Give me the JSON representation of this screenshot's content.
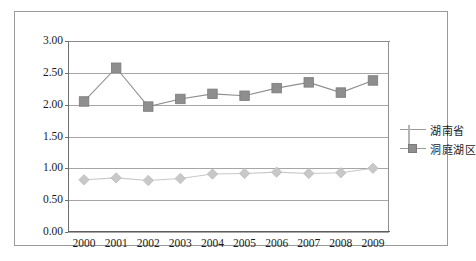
{
  "chart_data": {
    "type": "line",
    "title": "",
    "xlabel": "",
    "ylabel": "",
    "categories": [
      "2000",
      "2001",
      "2002",
      "2003",
      "2004",
      "2005",
      "2006",
      "2007",
      "2008",
      "2009"
    ],
    "series": [
      {
        "name": "湖南省",
        "marker": "diamond",
        "color": "#c8c8c8",
        "values": [
          0.82,
          0.85,
          0.81,
          0.84,
          0.91,
          0.92,
          0.94,
          0.92,
          0.93,
          1.0
        ]
      },
      {
        "name": "洞庭湖区",
        "marker": "square",
        "color": "#8e8e8e",
        "values": [
          2.05,
          2.58,
          1.97,
          2.09,
          2.17,
          2.14,
          2.26,
          2.35,
          2.19,
          2.38
        ]
      }
    ],
    "ylim": [
      0.0,
      3.0
    ],
    "yticks": [
      "0.00",
      "0.50",
      "1.00",
      "1.50",
      "2.00",
      "2.50",
      "3.00"
    ],
    "ytick_values": [
      0.0,
      0.5,
      1.0,
      1.5,
      2.0,
      2.5,
      3.0
    ],
    "grid": true,
    "legend_position": "right"
  },
  "legend": {
    "entries": [
      {
        "label": "湖南省"
      },
      {
        "label": "洞庭湖区"
      }
    ]
  },
  "colors": {
    "series_diamond": "#c8c8c8",
    "series_square": "#8e8e8e",
    "gridline": "#a6a6a6",
    "axis": "#5d5d5d",
    "frame": "#9a9a9a",
    "text": "#1a1a1a",
    "background": "#ffffff"
  }
}
